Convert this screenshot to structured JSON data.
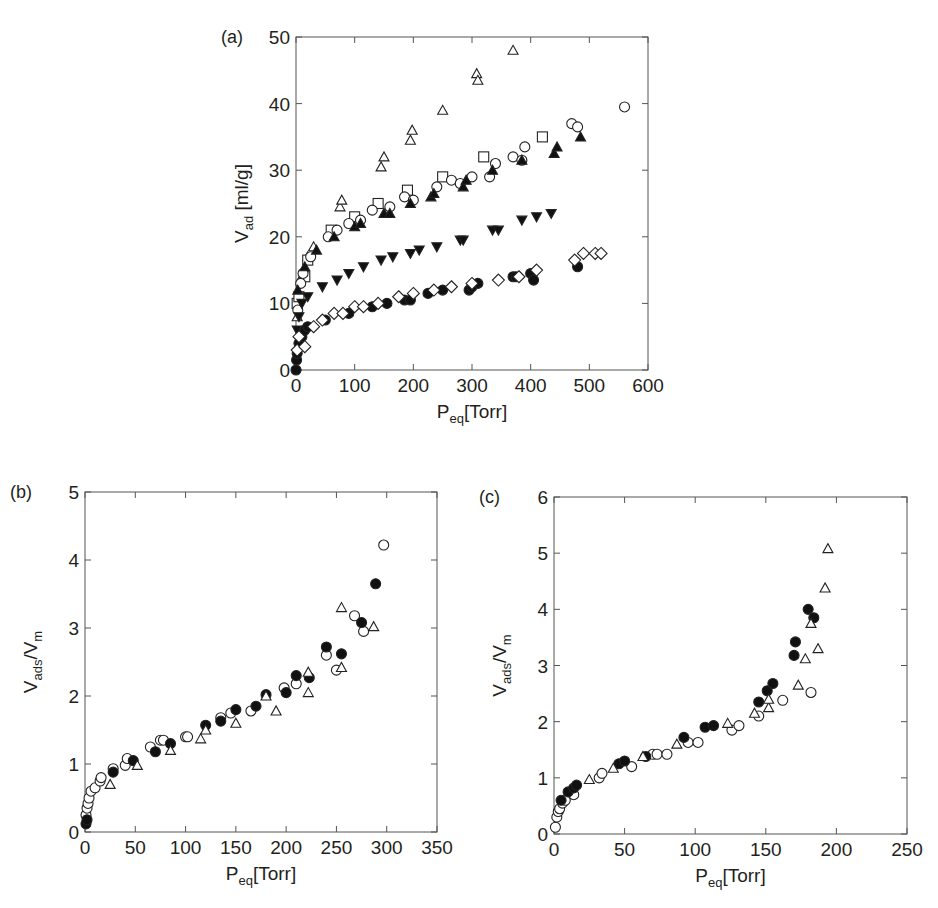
{
  "figure": {
    "panels": [
      "(a)",
      "(b)",
      "(c)"
    ]
  },
  "chart_data": [
    {
      "panel": "(a)",
      "type": "scatter",
      "title": "",
      "xlabel": "P_eq[Torr]",
      "xlabel_main": "P",
      "xlabel_sub": "eq",
      "xlabel_rest": "[Torr]",
      "ylabel": "V_ad [ml/g]",
      "ylabel_main": "V",
      "ylabel_sub": "ad",
      "ylabel_rest": " [ml/g]",
      "xlim": [
        0,
        600
      ],
      "ylim": [
        0,
        50
      ],
      "xticks": [
        0,
        100,
        200,
        300,
        400,
        500,
        600
      ],
      "yticks": [
        0,
        10,
        20,
        30,
        40,
        50
      ],
      "grid": false,
      "legend": null,
      "box": {
        "x0": 296,
        "x1": 648,
        "y0": 370,
        "y1": 37
      },
      "series": [
        {
          "name": "open triangle",
          "marker": "triangle-open",
          "points": [
            [
              2,
              8
            ],
            [
              5,
              11
            ],
            [
              10,
              14
            ],
            [
              20,
              17
            ],
            [
              30,
              18.5
            ],
            [
              75,
              24.5
            ],
            [
              78,
              25.5
            ],
            [
              145,
              30.5
            ],
            [
              150,
              32
            ],
            [
              195,
              34.5
            ],
            [
              198,
              36
            ],
            [
              250,
              39
            ],
            [
              308,
              44.5
            ],
            [
              310,
              43.5
            ],
            [
              370,
              48
            ]
          ]
        },
        {
          "name": "open square",
          "marker": "square-open",
          "points": [
            [
              2,
              10
            ],
            [
              5,
              11
            ],
            [
              15,
              14
            ],
            [
              20,
              16.5
            ],
            [
              60,
              21
            ],
            [
              100,
              23
            ],
            [
              140,
              25
            ],
            [
              190,
              27
            ],
            [
              250,
              29
            ],
            [
              320,
              32
            ],
            [
              420,
              35
            ]
          ]
        },
        {
          "name": "open circle",
          "marker": "circle-open",
          "points": [
            [
              3,
              9
            ],
            [
              8,
              13
            ],
            [
              12,
              14.5
            ],
            [
              25,
              17
            ],
            [
              55,
              20
            ],
            [
              70,
              21
            ],
            [
              90,
              22
            ],
            [
              110,
              22.5
            ],
            [
              130,
              24
            ],
            [
              160,
              24.5
            ],
            [
              185,
              26
            ],
            [
              200,
              25.5
            ],
            [
              240,
              27.5
            ],
            [
              265,
              28.5
            ],
            [
              280,
              28
            ],
            [
              300,
              29
            ],
            [
              330,
              29
            ],
            [
              340,
              31
            ],
            [
              370,
              32
            ],
            [
              385,
              31.5
            ],
            [
              390,
              33.5
            ],
            [
              470,
              37
            ],
            [
              480,
              36.5
            ],
            [
              560,
              39.5
            ]
          ]
        },
        {
          "name": "filled triangle up",
          "marker": "triangle-filled",
          "points": [
            [
              3,
              12
            ],
            [
              15,
              15.5
            ],
            [
              35,
              18
            ],
            [
              65,
              20
            ],
            [
              100,
              21.5
            ],
            [
              110,
              22
            ],
            [
              150,
              23.5
            ],
            [
              160,
              23.5
            ],
            [
              195,
              25
            ],
            [
              230,
              26
            ],
            [
              235,
              26.5
            ],
            [
              285,
              27.5
            ],
            [
              290,
              28.5
            ],
            [
              335,
              30
            ],
            [
              385,
              31.5
            ],
            [
              440,
              32.5
            ],
            [
              445,
              33.5
            ],
            [
              485,
              35
            ]
          ]
        },
        {
          "name": "filled triangle down",
          "marker": "triangle-down-filled",
          "points": [
            [
              2,
              6
            ],
            [
              5,
              8
            ],
            [
              10,
              10
            ],
            [
              20,
              11
            ],
            [
              45,
              12.5
            ],
            [
              70,
              13.5
            ],
            [
              90,
              14.5
            ],
            [
              115,
              15.5
            ],
            [
              145,
              16.5
            ],
            [
              165,
              17
            ],
            [
              195,
              17.5
            ],
            [
              210,
              18
            ],
            [
              240,
              18.5
            ],
            [
              280,
              19.5
            ],
            [
              285,
              19.5
            ],
            [
              335,
              21
            ],
            [
              345,
              21
            ],
            [
              385,
              22.5
            ],
            [
              410,
              23
            ],
            [
              435,
              23.5
            ]
          ]
        },
        {
          "name": "filled circle",
          "marker": "circle-filled",
          "points": [
            [
              0,
              0
            ],
            [
              1,
              1.5
            ],
            [
              2,
              2.5
            ],
            [
              5,
              4
            ],
            [
              10,
              5
            ],
            [
              15,
              6
            ],
            [
              20,
              6.5
            ],
            [
              50,
              7.5
            ],
            [
              90,
              8.5
            ],
            [
              130,
              9.5
            ],
            [
              155,
              10
            ],
            [
              185,
              10.5
            ],
            [
              195,
              10.5
            ],
            [
              225,
              11.5
            ],
            [
              250,
              12
            ],
            [
              295,
              12
            ],
            [
              300,
              12.5
            ],
            [
              310,
              13
            ],
            [
              370,
              14
            ],
            [
              375,
              14
            ],
            [
              400,
              14.5
            ],
            [
              405,
              13.5
            ],
            [
              480,
              15.5
            ]
          ]
        },
        {
          "name": "open diamond",
          "marker": "diamond-open",
          "points": [
            [
              2,
              3
            ],
            [
              5,
              5
            ],
            [
              15,
              3.5
            ],
            [
              30,
              6.5
            ],
            [
              45,
              7.5
            ],
            [
              65,
              8.5
            ],
            [
              80,
              8.5
            ],
            [
              100,
              9.5
            ],
            [
              115,
              9.5
            ],
            [
              140,
              10
            ],
            [
              175,
              11
            ],
            [
              200,
              11.5
            ],
            [
              235,
              12
            ],
            [
              265,
              12.5
            ],
            [
              300,
              13
            ],
            [
              345,
              13.5
            ],
            [
              380,
              14
            ],
            [
              410,
              15
            ],
            [
              475,
              16.5
            ],
            [
              490,
              17.5
            ],
            [
              510,
              17.5
            ],
            [
              520,
              17.5
            ]
          ]
        }
      ]
    },
    {
      "panel": "(b)",
      "type": "scatter",
      "title": "",
      "xlabel": "P_eq[Torr]",
      "xlabel_main": "P",
      "xlabel_sub": "eq",
      "xlabel_rest": "[Torr]",
      "ylabel": "V_ads/V_m",
      "ylabel_main": "V",
      "ylabel_sub": "ads",
      "ylabel_mid": "/V",
      "ylabel_sub2": "m",
      "xlim": [
        0,
        350
      ],
      "ylim": [
        0,
        5
      ],
      "xticks": [
        0,
        50,
        100,
        150,
        200,
        250,
        300,
        350
      ],
      "yticks": [
        0,
        1,
        2,
        3,
        4,
        5
      ],
      "grid": false,
      "legend": null,
      "box": {
        "x0": 85,
        "x1": 437,
        "y0": 832,
        "y1": 492
      },
      "series": [
        {
          "name": "open circle",
          "marker": "circle-open",
          "points": [
            [
              1,
              0.25
            ],
            [
              2,
              0.35
            ],
            [
              3,
              0.42
            ],
            [
              4,
              0.5
            ],
            [
              6,
              0.6
            ],
            [
              10,
              0.65
            ],
            [
              15,
              0.75
            ],
            [
              16,
              0.8
            ],
            [
              28,
              0.93
            ],
            [
              40,
              0.98
            ],
            [
              42,
              1.08
            ],
            [
              65,
              1.25
            ],
            [
              75,
              1.35
            ],
            [
              78,
              1.35
            ],
            [
              100,
              1.4
            ],
            [
              102,
              1.4
            ],
            [
              135,
              1.68
            ],
            [
              145,
              1.75
            ],
            [
              165,
              1.78
            ],
            [
              198,
              2.12
            ],
            [
              210,
              2.18
            ],
            [
              240,
              2.6
            ],
            [
              250,
              2.38
            ],
            [
              268,
              3.18
            ],
            [
              277,
              2.95
            ],
            [
              297,
              4.22
            ]
          ]
        },
        {
          "name": "filled circle",
          "marker": "circle-filled",
          "points": [
            [
              1,
              0.12
            ],
            [
              2,
              0.18
            ],
            [
              28,
              0.88
            ],
            [
              48,
              1.05
            ],
            [
              70,
              1.18
            ],
            [
              85,
              1.3
            ],
            [
              120,
              1.57
            ],
            [
              135,
              1.63
            ],
            [
              150,
              1.8
            ],
            [
              170,
              1.85
            ],
            [
              180,
              2.02
            ],
            [
              200,
              2.05
            ],
            [
              210,
              2.3
            ],
            [
              223,
              2.27
            ],
            [
              240,
              2.72
            ],
            [
              255,
              2.62
            ],
            [
              275,
              3.08
            ],
            [
              289,
              3.65
            ]
          ]
        },
        {
          "name": "open triangle",
          "marker": "triangle-open",
          "points": [
            [
              25,
              0.7
            ],
            [
              52,
              0.98
            ],
            [
              85,
              1.2
            ],
            [
              115,
              1.37
            ],
            [
              120,
              1.5
            ],
            [
              150,
              1.6
            ],
            [
              180,
              2
            ],
            [
              190,
              1.78
            ],
            [
              222,
              2.05
            ],
            [
              222,
              2.35
            ],
            [
              255,
              2.42
            ],
            [
              255,
              3.3
            ],
            [
              287,
              3.02
            ]
          ]
        }
      ]
    },
    {
      "panel": "(c)",
      "type": "scatter",
      "title": "",
      "xlabel": "P_eq[Torr]",
      "xlabel_main": "P",
      "xlabel_sub": "eq",
      "xlabel_rest": "[Torr]",
      "ylabel": "V_ads/V_m",
      "ylabel_main": "V",
      "ylabel_sub": "ads",
      "ylabel_mid": "/V",
      "ylabel_sub2": "m",
      "xlim": [
        0,
        250
      ],
      "ylim": [
        0,
        6
      ],
      "xticks": [
        0,
        50,
        100,
        150,
        200,
        250
      ],
      "yticks": [
        0,
        1,
        2,
        3,
        4,
        5,
        6
      ],
      "grid": false,
      "legend": null,
      "box": {
        "x0": 554,
        "x1": 907,
        "y0": 834,
        "y1": 497
      },
      "series": [
        {
          "name": "open circle",
          "marker": "circle-open",
          "points": [
            [
              1,
              0.12
            ],
            [
              2,
              0.3
            ],
            [
              3,
              0.4
            ],
            [
              4,
              0.45
            ],
            [
              6,
              0.55
            ],
            [
              8,
              0.6
            ],
            [
              14,
              0.7
            ],
            [
              32,
              1
            ],
            [
              34,
              1.08
            ],
            [
              55,
              1.2
            ],
            [
              70,
              1.42
            ],
            [
              73,
              1.42
            ],
            [
              80,
              1.42
            ],
            [
              95,
              1.63
            ],
            [
              102,
              1.63
            ],
            [
              126,
              1.85
            ],
            [
              131,
              1.93
            ],
            [
              145,
              2.1
            ],
            [
              162,
              2.38
            ],
            [
              182,
              2.52
            ]
          ]
        },
        {
          "name": "filled circle",
          "marker": "circle-filled",
          "points": [
            [
              5,
              0.6
            ],
            [
              10,
              0.75
            ],
            [
              14,
              0.82
            ],
            [
              16,
              0.87
            ],
            [
              46,
              1.25
            ],
            [
              50,
              1.3
            ],
            [
              65,
              1.38
            ],
            [
              92,
              1.72
            ],
            [
              107,
              1.9
            ],
            [
              113,
              1.93
            ],
            [
              145,
              2.35
            ],
            [
              151,
              2.55
            ],
            [
              155,
              2.68
            ],
            [
              170,
              3.18
            ],
            [
              171,
              3.42
            ],
            [
              180,
              4.0
            ],
            [
              184,
              3.85
            ]
          ]
        },
        {
          "name": "open triangle",
          "marker": "triangle-open",
          "points": [
            [
              25,
              0.97
            ],
            [
              42,
              1.17
            ],
            [
              63,
              1.38
            ],
            [
              87,
              1.6
            ],
            [
              123,
              1.97
            ],
            [
              142,
              2.15
            ],
            [
              152,
              2.25
            ],
            [
              152,
              2.4
            ],
            [
              173,
              2.65
            ],
            [
              178,
              3.12
            ],
            [
              182,
              3.75
            ],
            [
              187,
              3.3
            ],
            [
              192,
              4.38
            ],
            [
              194,
              5.08
            ]
          ]
        }
      ]
    }
  ]
}
